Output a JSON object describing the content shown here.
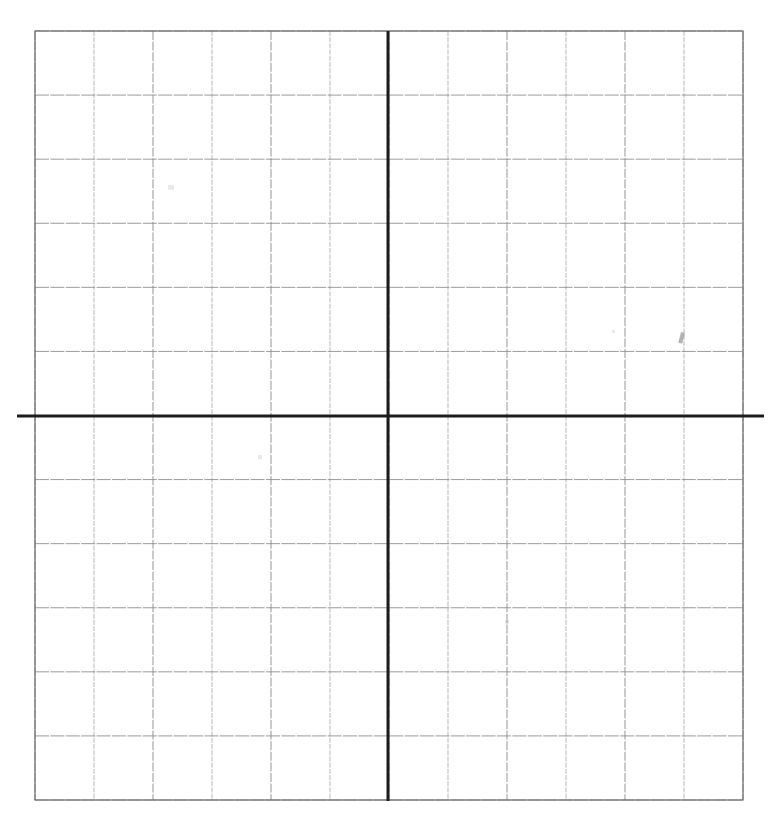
{
  "document": {
    "title": "Blank Cartesian Coordinate Grid",
    "kind": "scanned-graph-paper",
    "caption": "",
    "background_color": "#ffffff"
  },
  "chart_data": {
    "type": "scatter",
    "title": "",
    "subtitle": "",
    "xlabel": "",
    "ylabel": "",
    "series": [
      {
        "name": "",
        "x": [],
        "y": []
      }
    ],
    "categories": [],
    "values": [],
    "xlim": [
      -6,
      6
    ],
    "ylim": [
      -6,
      6
    ],
    "xticks": [
      -6,
      -5,
      -4,
      -3,
      -2,
      -1,
      0,
      1,
      2,
      3,
      4,
      5,
      6
    ],
    "yticks": [
      -6,
      -5,
      -4,
      -3,
      -2,
      -1,
      0,
      1,
      2,
      3,
      4,
      5,
      6
    ],
    "xtick_labels": [],
    "ytick_labels": [],
    "grid": true,
    "legend": [],
    "legend_position": "none",
    "annotations": []
  },
  "grid": {
    "columns": 12,
    "rows": 12,
    "left_px": 35,
    "top_px": 31,
    "right_px": 743,
    "bottom_px": 800,
    "cell_width_px": 59,
    "cell_height_px": 64.1,
    "minor_line_color": "#8d8d8d",
    "minor_line_width_px": 1,
    "border_line_color": "#6f6f6f",
    "border_line_width_px": 1.2
  },
  "axes": {
    "origin_x_px": 388,
    "origin_y_px": 416,
    "axis_color": "#1c1c1c",
    "axis_line_width_px": 3,
    "x_axis": {
      "name": "x-axis",
      "start_px": 17,
      "end_px": 764,
      "overhang_left_px": 18,
      "overhang_right_px": 21,
      "label": ""
    },
    "y_axis": {
      "name": "y-axis",
      "start_px": 31,
      "end_px": 801,
      "overhang_top_px": 0,
      "overhang_bottom_px": 0,
      "label": ""
    },
    "quadrants": [
      "I",
      "II",
      "III",
      "IV"
    ]
  },
  "artifacts": {
    "description": "faint scanner / pencil marks on the paper",
    "marks": [
      {
        "name": "pencil-tick-mark",
        "x_px": 681,
        "y_px": 332,
        "width_px": 4,
        "height_px": 11
      },
      {
        "name": "smudge-mark",
        "x_px": 168,
        "y_px": 185,
        "width_px": 6,
        "height_px": 5
      },
      {
        "name": "smudge-mark",
        "x_px": 612,
        "y_px": 330,
        "width_px": 3,
        "height_px": 3
      },
      {
        "name": "smudge-mark",
        "x_px": 258,
        "y_px": 455,
        "width_px": 4,
        "height_px": 4
      },
      {
        "name": "smudge-mark",
        "x_px": 505,
        "y_px": 620,
        "width_px": 4,
        "height_px": 4
      }
    ]
  }
}
